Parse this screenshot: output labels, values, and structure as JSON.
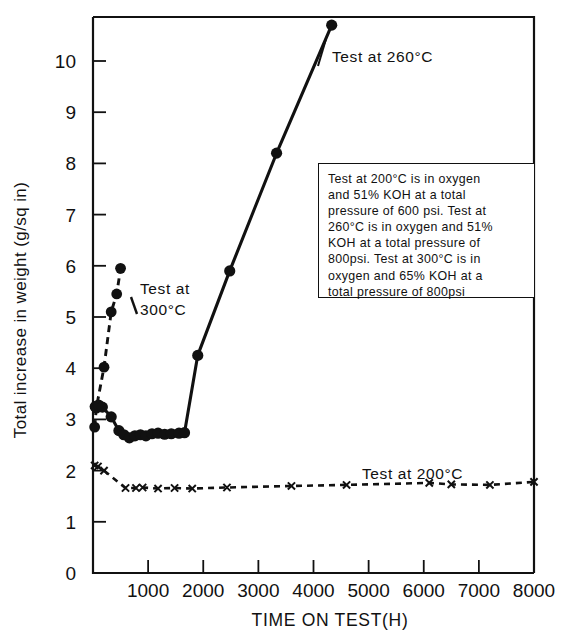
{
  "chart_data": {
    "type": "line",
    "title": "",
    "xlabel": "TIME ON TEST(H)",
    "ylabel": "Total increase in weight  (g/sq in)",
    "xlim": [
      0,
      8000
    ],
    "ylim": [
      0,
      10.8
    ],
    "grid": false,
    "legend_position": "inline-annotations",
    "xticks": [
      0,
      1000,
      2000,
      3000,
      4000,
      5000,
      6000,
      7000,
      8000
    ],
    "xticklabels": [
      "",
      "1000",
      "2000",
      "3000",
      "4000",
      "5000",
      "6000",
      "7000",
      "8000"
    ],
    "yticks": [
      0,
      1,
      2,
      3,
      4,
      5,
      6,
      7,
      8,
      9,
      10
    ],
    "yticklabels": [
      "0",
      "1",
      "2",
      "3",
      "4",
      "5",
      "6",
      "7",
      "8",
      "9",
      "10"
    ],
    "series": [
      {
        "name": "Test at 260°C",
        "marker": "filled-circle",
        "linestyle": "solid",
        "color": "#111111",
        "x": [
          40,
          100,
          170,
          330,
          470,
          560,
          660,
          760,
          860,
          960,
          1070,
          1180,
          1300,
          1420,
          1560,
          1660,
          1900,
          2480,
          3330,
          4330
        ],
        "y": [
          3.25,
          3.28,
          3.24,
          3.05,
          2.78,
          2.7,
          2.64,
          2.68,
          2.7,
          2.68,
          2.72,
          2.73,
          2.71,
          2.72,
          2.73,
          2.74,
          4.25,
          5.9,
          8.2,
          10.7
        ]
      },
      {
        "name": "Test at 300°C",
        "marker": "filled-circle",
        "linestyle": "dashed",
        "color": "#111111",
        "x": [
          30,
          60,
          200,
          330,
          430,
          500
        ],
        "y": [
          2.85,
          3.22,
          4.02,
          5.1,
          5.45,
          5.95
        ]
      },
      {
        "name": "Test at 200°C",
        "marker": "x",
        "linestyle": "dashed",
        "color": "#111111",
        "x": [
          30,
          90,
          200,
          590,
          780,
          900,
          1180,
          1480,
          1800,
          2430,
          3600,
          4600,
          6100,
          6500,
          7200,
          8000
        ],
        "y": [
          2.1,
          2.08,
          2.0,
          1.66,
          1.66,
          1.67,
          1.65,
          1.66,
          1.65,
          1.67,
          1.7,
          1.72,
          1.76,
          1.73,
          1.72,
          1.78
        ]
      }
    ],
    "annotations": [
      {
        "id": "label-260",
        "text": "Test at 260°C",
        "x": 4400,
        "y": 9.85
      },
      {
        "id": "label-300",
        "text": "Test at\n300°C",
        "x": 700,
        "y": 5.85
      },
      {
        "id": "label-200",
        "text": "Test at 200°C",
        "x": 5100,
        "y": 2.15
      },
      {
        "id": "note-box",
        "text": "Test at 200°C is in oxygen and 51% KOH at a total pressure of 600 psi. Test at 260°C is in oxygen and 51% KOH at a total pressure of 800psi. Test at 300°C is in oxygen and 65% KOH at a total pressure of 800psi"
      }
    ]
  },
  "chart": {
    "axis_title_x": "TIME ON TEST(H)",
    "axis_title_y": "Total increase in weight  (g/sq in)",
    "label_260": "Test at 260°C",
    "label_300": "Test at\n300°C",
    "label_200": "Test at 200°C",
    "note": "Test at 200°C is in oxygen\nand 51% KOH at a total\npressure of 600 psi. Test at\n260°C is in oxygen and 51%\nKOH at a total pressure of\n800psi. Test at 300°C is in\noxygen and 65% KOH at a\ntotal pressure of 800psi",
    "colors": {
      "ink": "#111111",
      "background": "#ffffff"
    }
  }
}
